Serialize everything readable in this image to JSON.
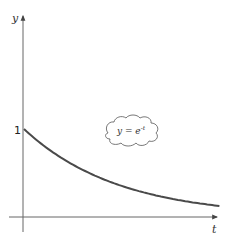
{
  "chart_data": {
    "type": "line",
    "title": "",
    "xlabel": "t",
    "ylabel": "y",
    "function": "y = e^-t",
    "annotation": {
      "text_base": "y = e",
      "text_exp": "-t",
      "style": "cloud"
    },
    "y_ticks": [
      {
        "value": 1,
        "label": "1"
      }
    ],
    "x_ticks": [],
    "xlim": [
      0,
      2.1
    ],
    "ylim": [
      0,
      2.0
    ],
    "grid": false,
    "legend": "none",
    "series": [
      {
        "name": "y = e^-t",
        "color": "#4a4a4a",
        "x": [
          0,
          0.25,
          0.5,
          0.75,
          1.0,
          1.25,
          1.5,
          1.75,
          2.0,
          2.08
        ],
        "y": [
          1.0,
          0.779,
          0.607,
          0.472,
          0.368,
          0.287,
          0.223,
          0.174,
          0.135,
          0.125
        ]
      }
    ]
  },
  "axes": {
    "x_label": "t",
    "y_label": "y",
    "y_tick_1": "1"
  },
  "colors": {
    "axis": "#666666",
    "curve": "#4a4a4a",
    "text": "#333333"
  }
}
